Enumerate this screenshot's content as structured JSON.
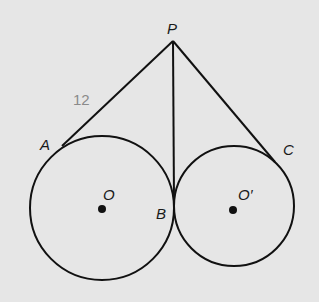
{
  "diagram": {
    "type": "geometry",
    "background_color": "#e6e6e6",
    "line_color": "#111111",
    "points": {
      "P": {
        "label": "P",
        "x": 173,
        "y": 41
      },
      "A": {
        "label": "A",
        "x": 62,
        "y": 146
      },
      "B": {
        "label": "B",
        "x": 174,
        "y": 201
      },
      "C": {
        "label": "C",
        "x": 275,
        "y": 162
      },
      "O": {
        "label": "O",
        "x": 102,
        "y": 209
      },
      "O_prime": {
        "label": "O′",
        "x": 233,
        "y": 210
      }
    },
    "circles": [
      {
        "name": "circle-O",
        "center": "O",
        "cx": 102,
        "cy": 208,
        "r": 72
      },
      {
        "name": "circle-O-prime",
        "center": "O_prime",
        "cx": 234,
        "cy": 206,
        "r": 60
      }
    ],
    "segments": [
      {
        "from": "P",
        "to": "A"
      },
      {
        "from": "P",
        "to": "B"
      },
      {
        "from": "P",
        "to": "C"
      }
    ],
    "annotations": [
      {
        "text": "12",
        "segment": "PA",
        "color": "#8a8a8a"
      }
    ]
  }
}
